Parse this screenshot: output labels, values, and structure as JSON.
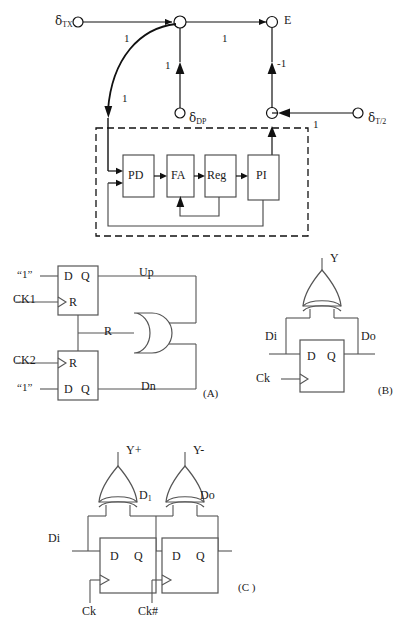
{
  "figure": {
    "panels": [
      "(A)",
      "(B)",
      "(C)"
    ]
  },
  "sfg": {
    "nodes": [
      {
        "id": "n_tx",
        "label": "δ",
        "sub": "TX"
      },
      {
        "id": "n_sum",
        "label": "",
        "sub": ""
      },
      {
        "id": "n_e",
        "label": "E",
        "sub": ""
      },
      {
        "id": "n_dp",
        "label": "δ",
        "sub": "DP"
      },
      {
        "id": "n_fb",
        "label": "",
        "sub": ""
      },
      {
        "id": "n_t2",
        "label": "δ",
        "sub": "T/2"
      }
    ],
    "node_labels": {
      "tx": "δ",
      "tx_sub": "TX",
      "e": "E",
      "dp": "δ",
      "dp_sub": "DP",
      "t2": "δ",
      "t2_sub": "T/2"
    },
    "edge_weights": {
      "tx_to_sum": "1",
      "tx_curve_to_loop": "1",
      "sum_to_e": "1",
      "dp_to_sum": "1",
      "fb_to_e": "-1",
      "t2_to_fb": "1"
    },
    "loop_blocks": [
      {
        "id": "pd",
        "label": "PD"
      },
      {
        "id": "fa",
        "label": "FA"
      },
      {
        "id": "reg",
        "label": "Reg"
      },
      {
        "id": "pi",
        "label": "PI"
      }
    ]
  },
  "panel_a": {
    "caption": "(A)",
    "top_ff": {
      "d_pin": "D",
      "q_pin": "Q",
      "r_pin": "R",
      "d_input": "“1”",
      "clk_input": "CK1",
      "q_output": "Up"
    },
    "bottom_ff": {
      "r_pin": "R",
      "d_pin": "D",
      "q_pin": "Q",
      "d_input": "“1”",
      "clk_input": "CK2",
      "q_output": "Dn"
    },
    "and_gate": {
      "name": "AND",
      "reset_label": "R"
    }
  },
  "panel_b": {
    "caption": "(B)",
    "xor_output": "Y",
    "ff": {
      "d_pin": "D",
      "q_pin": "Q"
    },
    "data_in": "Di",
    "data_out": "Do",
    "clock": "Ck"
  },
  "panel_c": {
    "caption": "(C )",
    "xor_outputs": [
      "Y+",
      "Y-"
    ],
    "ff_left": {
      "d_pin": "D",
      "q_pin": "Q"
    },
    "ff_right": {
      "d_pin": "D",
      "q_pin": "Q"
    },
    "data_in": "Di",
    "mid_node": "D",
    "mid_node_sub": "1",
    "data_out": "Do",
    "clock_left": "Ck",
    "clock_right": "Ck#"
  },
  "colors": {
    "ink": "#1a1a1a",
    "wire": "#444444",
    "background": "#ffffff"
  }
}
